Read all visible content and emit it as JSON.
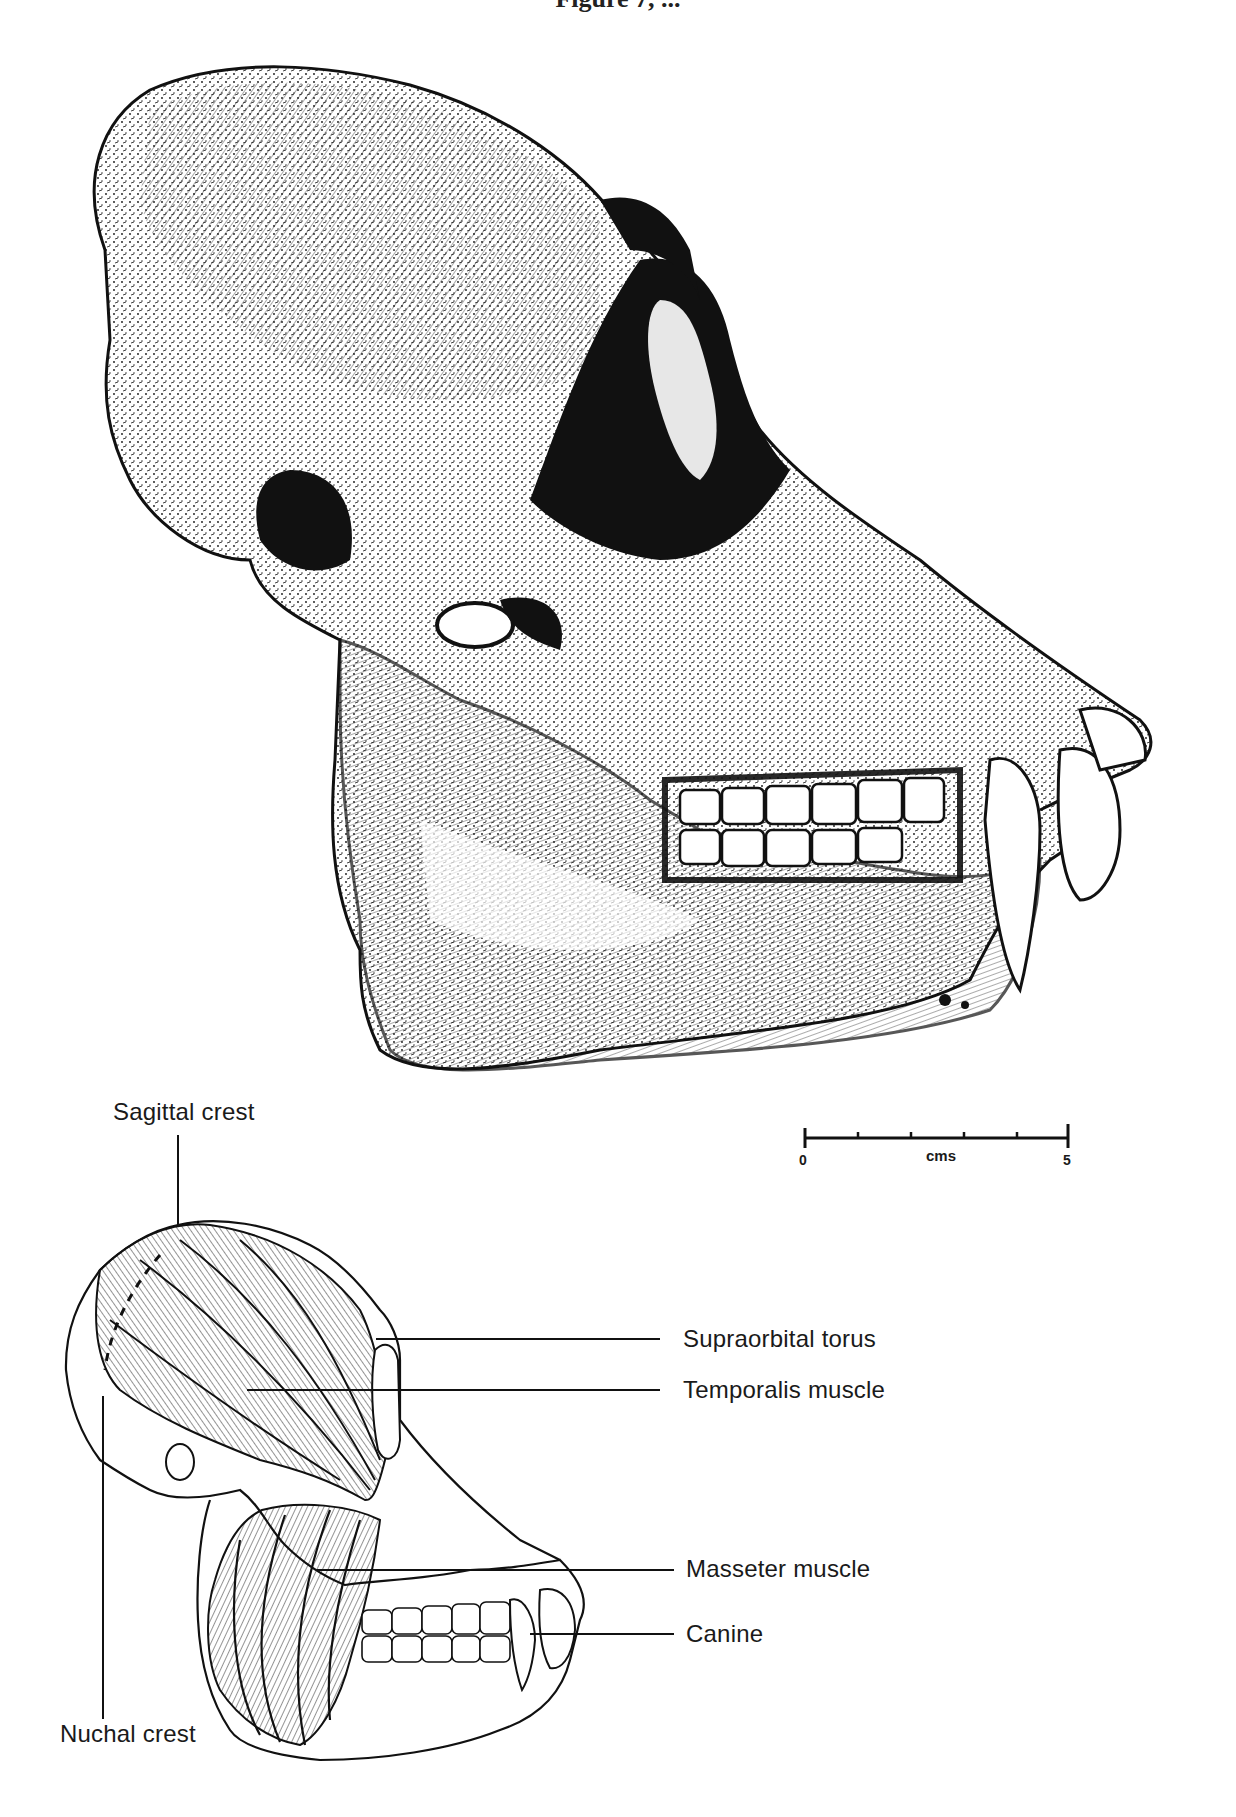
{
  "page": {
    "header_fragment": "Figure 7, ..."
  },
  "figure_top": {
    "subject": "gorilla skull, lateral view (stippled ink drawing)",
    "scale_bar": {
      "start_label": "0",
      "end_label": "5",
      "unit_label": "cms",
      "tick_count": 6
    }
  },
  "figure_bottom": {
    "subject": "gorilla skull outline with chewing muscles",
    "labels": [
      {
        "id": "sagittal-crest",
        "text": "Sagittal crest"
      },
      {
        "id": "supraorbital-torus",
        "text": "Supraorbital torus"
      },
      {
        "id": "temporalis-muscle",
        "text": "Temporalis muscle"
      },
      {
        "id": "masseter-muscle",
        "text": "Masseter muscle"
      },
      {
        "id": "canine",
        "text": "Canine"
      },
      {
        "id": "nuchal-crest",
        "text": "Nuchal crest"
      }
    ]
  },
  "colors": {
    "ink": "#111111",
    "paper": "#ffffff",
    "label": "#1a1a1a"
  }
}
